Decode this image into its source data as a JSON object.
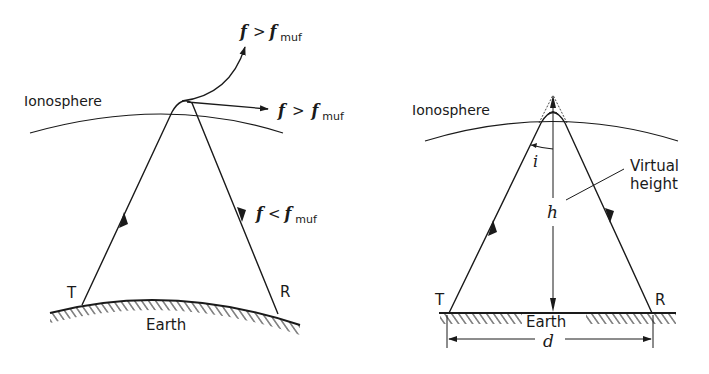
{
  "left_diagram": {
    "ionosphere_label": "Ionosphere",
    "earth_label": "Earth",
    "transmitter_label": "T",
    "receiver_label": "R",
    "ray_escape_label": {
      "f": "f",
      "op": ">",
      "fsub": "f",
      "sub": "muf"
    },
    "ray_horizontal_label": {
      "f": "f",
      "op": ">",
      "fsub": "f",
      "sub": "muf"
    },
    "ray_reflected_label": {
      "f": "f",
      "op": "<",
      "fsub": "f",
      "sub": "muf"
    }
  },
  "right_diagram": {
    "ionosphere_label": "Ionosphere",
    "earth_label": "Earth",
    "transmitter_label": "T",
    "receiver_label": "R",
    "angle_label": "i",
    "height_label": "h",
    "distance_label": "d",
    "virtual_height_label_line1": "Virtual",
    "virtual_height_label_line2": "height"
  },
  "colors": {
    "ink": "#1a1a1a",
    "background": "#ffffff"
  }
}
